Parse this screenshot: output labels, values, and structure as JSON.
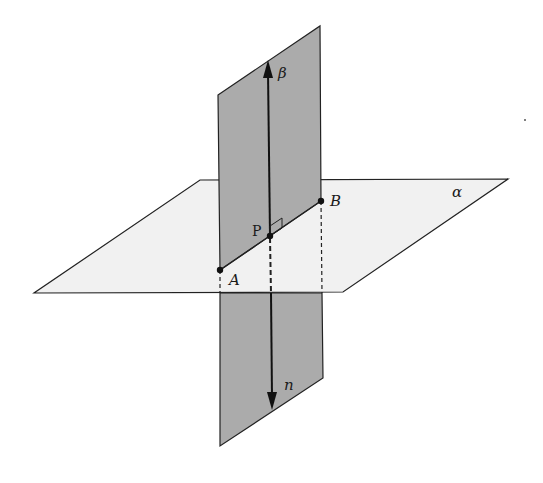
{
  "diagram": {
    "colors": {
      "vertical_plane": "#ababab",
      "horizontal_plane": "#f1f1f1",
      "stroke": "#222222"
    },
    "planes": {
      "alpha": {
        "label": "α"
      },
      "beta": {
        "label": "β"
      }
    },
    "points": {
      "A": {
        "label": "A"
      },
      "B": {
        "label": "B"
      },
      "P": {
        "label": "P"
      }
    },
    "vector": {
      "label": "n"
    }
  }
}
